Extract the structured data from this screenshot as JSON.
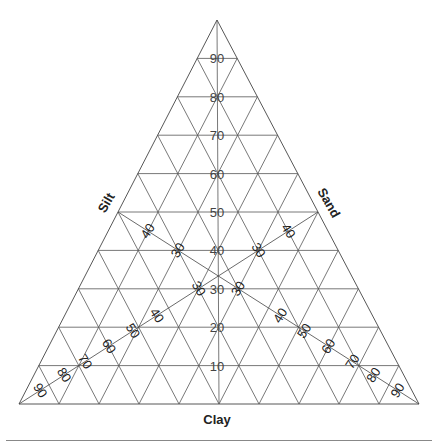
{
  "diagram": {
    "type": "ternary",
    "title": "",
    "axes": {
      "bottom_label": "Clay",
      "left_label": "Silt",
      "right_label": "Sand"
    },
    "divisions": 10,
    "center_scale_labels": [
      "10",
      "20",
      "30",
      "40",
      "50",
      "60",
      "70",
      "80",
      "90"
    ],
    "diagonal_lines": [
      {
        "name": "silt-diagonal",
        "from": "left-edge-50",
        "to": "bottom-right-vertex"
      },
      {
        "name": "sand-diagonal",
        "from": "right-edge-50",
        "to": "bottom-left-vertex"
      }
    ],
    "diagonal_labels_left_to_right": [
      "90",
      "80",
      "70",
      "60",
      "50",
      "40",
      "30"
    ],
    "diagonal_labels_right_to_left": [
      "90",
      "80",
      "70",
      "60",
      "50",
      "40",
      "30"
    ],
    "diagonal_label_upper": [
      "40",
      "30",
      "40",
      "30"
    ],
    "colors": {
      "lines": "#555555",
      "text": "#222222",
      "rule": "#888888"
    }
  }
}
